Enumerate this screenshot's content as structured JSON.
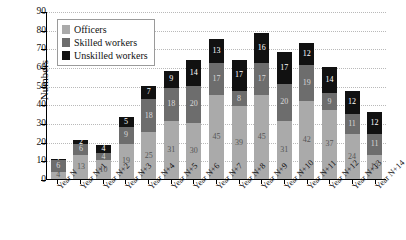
{
  "chart_data": {
    "type": "bar",
    "stacked": true,
    "title": "",
    "xlabel": "",
    "ylabel": "Numbers",
    "ylim": [
      0,
      90
    ],
    "ytick_step": 10,
    "yticks": [
      0,
      10,
      20,
      30,
      40,
      50,
      60,
      70,
      80,
      90
    ],
    "grid": true,
    "legend_position": "top-left",
    "categories": [
      "Year N",
      "Year N+1",
      "Year N+2",
      "Year N+3",
      "Year N+4",
      "Year N+5",
      "Year N+6",
      "Year N+7",
      "Year N+8",
      "Year N+9",
      "Year N+10",
      "Year N+11",
      "Year N+12",
      "Year N+13",
      "Year N+14"
    ],
    "series": [
      {
        "name": "Officers",
        "color": "#aaaaaa",
        "values": [
          4,
          13,
          10,
          19,
          25,
          31,
          30,
          45,
          39,
          45,
          31,
          42,
          37,
          24,
          13
        ]
      },
      {
        "name": "Skilled workers",
        "color": "#6d6d6d",
        "values": [
          6,
          6,
          4,
          9,
          18,
          18,
          20,
          17,
          8,
          17,
          20,
          19,
          9,
          11,
          11
        ]
      },
      {
        "name": "Unskilled workers",
        "color": "#111111",
        "values": [
          1,
          2,
          4,
          5,
          7,
          9,
          14,
          13,
          17,
          16,
          17,
          12,
          14,
          12,
          12
        ]
      }
    ],
    "totals": [
      11,
      21,
      18,
      33,
      50,
      58,
      64,
      75,
      64,
      78,
      68,
      73,
      60,
      47,
      36
    ]
  },
  "legend": {
    "items": [
      {
        "label": "Officers"
      },
      {
        "label": "Skilled workers"
      },
      {
        "label": "Unskilled workers"
      }
    ]
  }
}
